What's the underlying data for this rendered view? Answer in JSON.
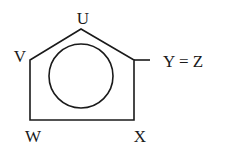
{
  "diagram": {
    "labels": {
      "top": "U",
      "upper_left": "V",
      "bottom_left": "W",
      "bottom_right": "X",
      "right_equation": "Y = Z"
    },
    "shapes": {
      "outer": "pentagon (house shape)",
      "inner": "circle"
    },
    "colors": {
      "stroke": "#1a1a1a",
      "background": "#ffffff"
    }
  }
}
